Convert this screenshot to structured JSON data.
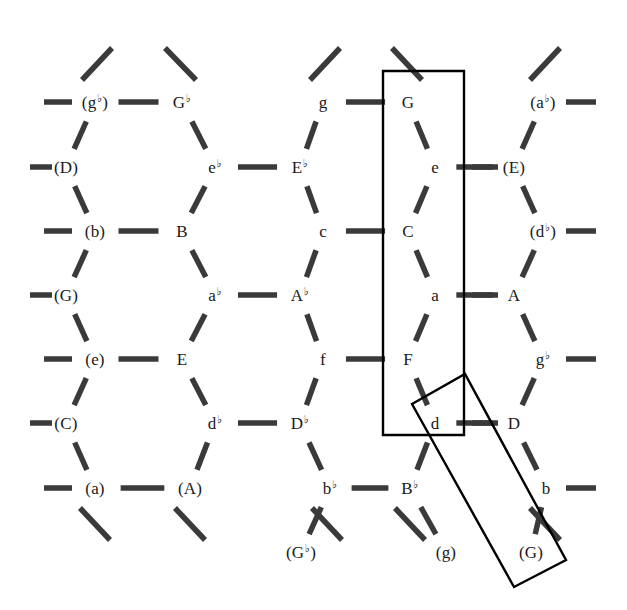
{
  "figure": {
    "name": "tonnetz-lattice",
    "width": 627,
    "height": 610,
    "background_color": "#ffffff",
    "edge_color": "#3a3a3a",
    "text_color": "#1a1a1a",
    "box_color": "#000000"
  },
  "nodes": [
    {
      "id": "n-0-0",
      "base": "g",
      "accidental": "flat",
      "parenthesized": true,
      "x": 95,
      "y": 102
    },
    {
      "id": "n-0-1",
      "base": "G",
      "accidental": "flat",
      "parenthesized": false,
      "x": 182,
      "y": 102
    },
    {
      "id": "n-0-2",
      "base": "g",
      "accidental": "",
      "parenthesized": false,
      "x": 323,
      "y": 102
    },
    {
      "id": "n-0-3",
      "base": "G",
      "accidental": "",
      "parenthesized": false,
      "x": 408,
      "y": 102
    },
    {
      "id": "n-0-4",
      "base": "a",
      "accidental": "flat",
      "parenthesized": true,
      "x": 543,
      "y": 102
    },
    {
      "id": "n-1-0",
      "base": "D",
      "accidental": "",
      "parenthesized": true,
      "x": 66,
      "y": 167
    },
    {
      "id": "n-1-1",
      "base": "e",
      "accidental": "flat",
      "parenthesized": false,
      "x": 215,
      "y": 167
    },
    {
      "id": "n-1-2",
      "base": "E",
      "accidental": "flat",
      "parenthesized": false,
      "x": 300,
      "y": 167
    },
    {
      "id": "n-1-3",
      "base": "e",
      "accidental": "",
      "parenthesized": false,
      "x": 435,
      "y": 167
    },
    {
      "id": "n-1-4",
      "base": "E",
      "accidental": "",
      "parenthesized": true,
      "x": 514,
      "y": 167
    },
    {
      "id": "n-2-0",
      "base": "b",
      "accidental": "",
      "parenthesized": true,
      "x": 95,
      "y": 231
    },
    {
      "id": "n-2-1",
      "base": "B",
      "accidental": "",
      "parenthesized": false,
      "x": 182,
      "y": 231
    },
    {
      "id": "n-2-2",
      "base": "c",
      "accidental": "",
      "parenthesized": false,
      "x": 323,
      "y": 231
    },
    {
      "id": "n-2-3",
      "base": "C",
      "accidental": "",
      "parenthesized": false,
      "x": 408,
      "y": 231
    },
    {
      "id": "n-2-4",
      "base": "d",
      "accidental": "flat",
      "parenthesized": true,
      "x": 543,
      "y": 231
    },
    {
      "id": "n-3-0",
      "base": "G",
      "accidental": "",
      "parenthesized": true,
      "x": 66,
      "y": 295
    },
    {
      "id": "n-3-1",
      "base": "a",
      "accidental": "flat",
      "parenthesized": false,
      "x": 215,
      "y": 295
    },
    {
      "id": "n-3-2",
      "base": "A",
      "accidental": "flat",
      "parenthesized": false,
      "x": 300,
      "y": 295
    },
    {
      "id": "n-3-3",
      "base": "a",
      "accidental": "",
      "parenthesized": false,
      "x": 435,
      "y": 295
    },
    {
      "id": "n-3-4",
      "base": "A",
      "accidental": "",
      "parenthesized": false,
      "x": 514,
      "y": 295
    },
    {
      "id": "n-4-0",
      "base": "e",
      "accidental": "",
      "parenthesized": true,
      "x": 95,
      "y": 359
    },
    {
      "id": "n-4-1",
      "base": "E",
      "accidental": "",
      "parenthesized": false,
      "x": 182,
      "y": 359
    },
    {
      "id": "n-4-2",
      "base": "f",
      "accidental": "",
      "parenthesized": false,
      "x": 323,
      "y": 359
    },
    {
      "id": "n-4-3",
      "base": "F",
      "accidental": "",
      "parenthesized": false,
      "x": 408,
      "y": 359
    },
    {
      "id": "n-4-4",
      "base": "g",
      "accidental": "flat",
      "parenthesized": false,
      "x": 543,
      "y": 359
    },
    {
      "id": "n-5-0",
      "base": "C",
      "accidental": "",
      "parenthesized": true,
      "x": 66,
      "y": 423
    },
    {
      "id": "n-5-1",
      "base": "d",
      "accidental": "flat",
      "parenthesized": false,
      "x": 215,
      "y": 423
    },
    {
      "id": "n-5-2",
      "base": "D",
      "accidental": "flat",
      "parenthesized": false,
      "x": 300,
      "y": 423
    },
    {
      "id": "n-5-3",
      "base": "d",
      "accidental": "",
      "parenthesized": false,
      "x": 435,
      "y": 423
    },
    {
      "id": "n-5-4",
      "base": "D",
      "accidental": "",
      "parenthesized": false,
      "x": 514,
      "y": 423
    },
    {
      "id": "n-6-0",
      "base": "a",
      "accidental": "",
      "parenthesized": true,
      "x": 95,
      "y": 488
    },
    {
      "id": "n-6-1",
      "base": "A",
      "accidental": "",
      "parenthesized": true,
      "x": 190,
      "y": 488
    },
    {
      "id": "n-6-2",
      "base": "b",
      "accidental": "flat",
      "parenthesized": false,
      "x": 330,
      "y": 488
    },
    {
      "id": "n-6-3",
      "base": "B",
      "accidental": "flat",
      "parenthesized": false,
      "x": 410,
      "y": 488
    },
    {
      "id": "n-6-4",
      "base": "b",
      "accidental": "",
      "parenthesized": false,
      "x": 546,
      "y": 488
    },
    {
      "id": "n-7-2",
      "base": "G",
      "accidental": "flat",
      "parenthesized": true,
      "x": 301,
      "y": 552
    },
    {
      "id": "n-7-3",
      "base": "g",
      "accidental": "",
      "parenthesized": true,
      "x": 446,
      "y": 552
    },
    {
      "id": "n-7-4",
      "base": "G",
      "accidental": "",
      "parenthesized": true,
      "x": 531,
      "y": 552
    }
  ],
  "boxes": [
    {
      "id": "box-upright",
      "name": "upright-selection-box",
      "points": "383,71 464,71 464,435 383,435",
      "rotation_deg": 0
    },
    {
      "id": "box-tilted",
      "name": "tilted-selection-box",
      "points": "412,404 465,374 566,560 514,587",
      "rotation_deg": 27
    }
  ],
  "edges_note": "short dashes connect lattice nodes: horizontal perfect-fifth links and diagonal third links"
}
